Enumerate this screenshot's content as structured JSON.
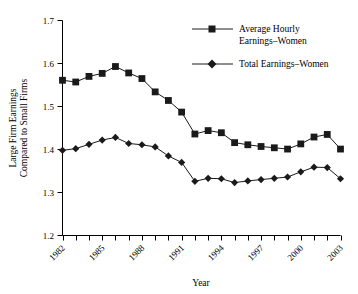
{
  "chart_data": {
    "type": "line",
    "title": "",
    "xlabel": "Year",
    "ylabel": "Large Firm Earnings Compared to Small Firms",
    "ylabel_lines": [
      "Large Firm Earnings",
      "Compared to Small Firms"
    ],
    "ylim": [
      1.2,
      1.7
    ],
    "xlim": [
      1982,
      2003
    ],
    "yticks": [
      "1.2",
      "1.3",
      "1.4",
      "1.5",
      "1.6",
      "1.7"
    ],
    "ytick_values": [
      1.2,
      1.3,
      1.4,
      1.5,
      1.6,
      1.7
    ],
    "xticks_all": [
      1982,
      1983,
      1984,
      1985,
      1986,
      1987,
      1988,
      1989,
      1990,
      1991,
      1992,
      1993,
      1994,
      1995,
      1996,
      1997,
      1998,
      1999,
      2000,
      2001,
      2002,
      2003
    ],
    "xtick_labels": [
      "1982",
      "1985",
      "1988",
      "1991",
      "1994",
      "1997",
      "2000",
      "2003"
    ],
    "xtick_label_values": [
      1982,
      1985,
      1988,
      1991,
      1994,
      1997,
      2000,
      2003
    ],
    "grid": false,
    "legend_position": "top-right",
    "x": [
      1982,
      1983,
      1984,
      1985,
      1986,
      1987,
      1988,
      1989,
      1990,
      1991,
      1992,
      1993,
      1994,
      1995,
      1996,
      1997,
      1998,
      1999,
      2000,
      2001,
      2002,
      2003
    ],
    "series": [
      {
        "name": "Average Hourly Earnings–Women",
        "name_lines": [
          "Average Hourly",
          "Earnings–Women"
        ],
        "marker": "square",
        "color": "#1a1a1a",
        "values": [
          1.561,
          1.557,
          1.57,
          1.577,
          1.593,
          1.578,
          1.565,
          1.534,
          1.514,
          1.487,
          1.436,
          1.444,
          1.439,
          1.416,
          1.411,
          1.407,
          1.404,
          1.401,
          1.413,
          1.429,
          1.435,
          1.401
        ]
      },
      {
        "name": "Total Earnings–Women",
        "name_lines": [
          "Total Earnings–Women"
        ],
        "marker": "diamond",
        "color": "#1a1a1a",
        "values": [
          1.398,
          1.402,
          1.412,
          1.422,
          1.428,
          1.414,
          1.411,
          1.406,
          1.385,
          1.37,
          1.326,
          1.333,
          1.332,
          1.323,
          1.327,
          1.33,
          1.333,
          1.336,
          1.348,
          1.359,
          1.358,
          1.332
        ]
      }
    ]
  },
  "axis": {
    "x_title": "Year",
    "y_title_line1": "Large Firm Earnings",
    "y_title_line2": "Compared to Small Firms"
  },
  "legend": {
    "entry1_line1": "Average Hourly",
    "entry1_line2": "Earnings–Women",
    "entry2_line1": "Total Earnings–Women"
  }
}
